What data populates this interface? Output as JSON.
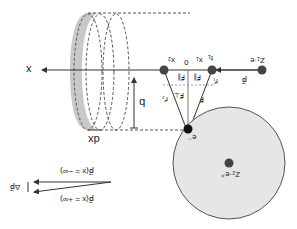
{
  "diagram": {
    "orientation": "rotated-180",
    "colors": {
      "line": "#333333",
      "dashed": "#555555",
      "disk_fill": "#c8c8c8",
      "sphere_fill": "#e6e6e6",
      "sphere_stroke": "#555555",
      "dot": "#444444",
      "electron": "#111111"
    },
    "labels": {
      "x_axis": "x",
      "dx": "dx",
      "b": "b",
      "x1": "x₁",
      "x2": "x₂",
      "zero": "0",
      "t1": "t₁",
      "z1e": "Z₁·e",
      "p": "p⃗",
      "r1": "r⃗₁",
      "r2": "r⃗₂",
      "F": "F⃗",
      "F_par_1": "F⃗∥",
      "F_par_2": "F⃗∥",
      "F_perp": "F⃗⊥",
      "electron": "e⁻",
      "z2e": "Z₂·e⁺",
      "p_minus_inf": "p⃗(x = −∞)",
      "p_plus_inf": "p⃗(x = +∞)",
      "delta_p": "Δp⃗"
    }
  }
}
